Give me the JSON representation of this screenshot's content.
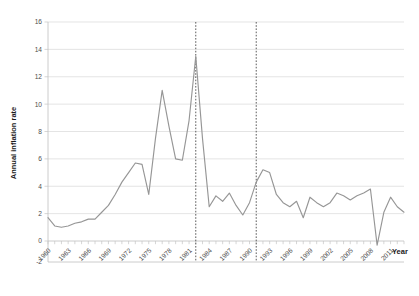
{
  "chart_data": {
    "type": "line",
    "title": "",
    "xlabel": "Year",
    "ylabel": "Annual inflation rate",
    "xlim": [
      1960,
      2013
    ],
    "ylim": [
      -2,
      16
    ],
    "ytick_step": 2,
    "xtick_step": 3,
    "grid": true,
    "legend": "none",
    "yticks": [
      -2,
      0,
      2,
      4,
      6,
      8,
      10,
      12,
      14,
      16
    ],
    "ytick_labels": [
      "-2",
      "0",
      "2",
      "4",
      "6",
      "8",
      "10",
      "12",
      "14",
      "16"
    ],
    "xticks": [
      1960,
      1963,
      1966,
      1969,
      1972,
      1975,
      1978,
      1981,
      1984,
      1987,
      1990,
      1993,
      1996,
      1999,
      2002,
      2005,
      2008,
      2011
    ],
    "xtick_labels": [
      "1960",
      "1963",
      "1966",
      "1969",
      "1972",
      "1975",
      "1978",
      "1981",
      "1984",
      "1987",
      "1990",
      "1993",
      "1996",
      "1999",
      "2002",
      "2005",
      "2008",
      "2011"
    ],
    "line_color": "#969696",
    "grid_color": "#d9d9d9",
    "annotation_lines": [
      {
        "name": "event-line-1982",
        "x": 1982,
        "style": "dashed",
        "color": "#4a4a4a"
      },
      {
        "name": "event-line-1991",
        "x": 1991,
        "style": "dashed",
        "color": "#4a4a4a"
      }
    ],
    "x": [
      1960,
      1961,
      1962,
      1963,
      1964,
      1965,
      1966,
      1967,
      1968,
      1969,
      1970,
      1971,
      1972,
      1973,
      1974,
      1975,
      1976,
      1977,
      1978,
      1979,
      1980,
      1981,
      1982,
      1983,
      1984,
      1985,
      1986,
      1987,
      1988,
      1989,
      1990,
      1991,
      1992,
      1993,
      1994,
      1995,
      1996,
      1997,
      1998,
      1999,
      2000,
      2001,
      2002,
      2003,
      2004,
      2005,
      2006,
      2007,
      2008,
      2009,
      2010,
      2011,
      2012,
      2013
    ],
    "values": [
      1.7,
      1.1,
      1.0,
      1.1,
      1.3,
      1.4,
      1.6,
      1.6,
      2.1,
      2.6,
      3.4,
      4.3,
      5.0,
      5.7,
      5.6,
      3.4,
      7.5,
      11.0,
      8.4,
      6.0,
      5.9,
      8.8,
      13.5,
      7.5,
      2.5,
      3.3,
      2.9,
      3.5,
      2.6,
      1.9,
      2.8,
      4.3,
      5.2,
      5.0,
      3.4,
      2.8,
      2.5,
      2.9,
      1.7,
      3.2,
      2.8,
      2.5,
      2.8,
      3.5,
      3.3,
      3.0,
      3.3,
      3.5,
      3.8,
      -0.3,
      2.1,
      3.2,
      2.5,
      2.1
    ],
    "series": [
      {
        "name": "Annual inflation rate",
        "values": [
          1.7,
          1.1,
          1.0,
          1.1,
          1.3,
          1.4,
          1.6,
          1.6,
          2.1,
          2.6,
          3.4,
          4.3,
          5.0,
          5.7,
          5.6,
          3.4,
          7.5,
          11.0,
          8.4,
          6.0,
          5.9,
          8.8,
          13.5,
          7.5,
          2.5,
          3.3,
          2.9,
          3.5,
          2.6,
          1.9,
          2.8,
          4.3,
          5.2,
          5.0,
          3.4,
          2.8,
          2.5,
          2.9,
          1.7,
          3.2,
          2.8,
          2.5,
          2.8,
          3.5,
          3.3,
          3.0,
          3.3,
          3.5,
          3.8,
          -0.3,
          2.1,
          3.2,
          2.5,
          2.1
        ]
      }
    ]
  }
}
